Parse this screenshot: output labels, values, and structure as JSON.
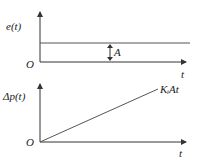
{
  "top_plot": {
    "ylabel": "e(t)",
    "xlabel": "t",
    "origin": "O",
    "amplitude_label": "A"
  },
  "bottom_plot": {
    "ylabel": "Δp(t)",
    "xlabel": "t",
    "origin": "O",
    "line_label": "KᵢAt"
  }
}
